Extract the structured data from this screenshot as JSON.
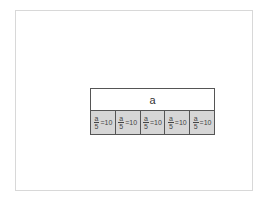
{
  "diagram": {
    "whole_label": "a",
    "parts": [
      {
        "numerator": "a",
        "denominator": "5",
        "rest": "=10"
      },
      {
        "numerator": "a",
        "denominator": "5",
        "rest": "=10"
      },
      {
        "numerator": "a",
        "denominator": "5",
        "rest": "=10"
      },
      {
        "numerator": "a",
        "denominator": "5",
        "rest": "=10"
      },
      {
        "numerator": "a",
        "denominator": "5",
        "rest": "=10"
      }
    ],
    "colors": {
      "part_fill": "#d6d6d6",
      "border": "#555555"
    }
  }
}
